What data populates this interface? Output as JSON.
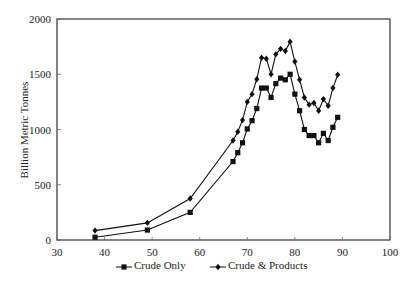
{
  "chart_data": {
    "type": "line",
    "title": "",
    "xlabel": "",
    "ylabel": "Billion Metric Tonnes",
    "xlim": [
      30,
      100
    ],
    "ylim": [
      0,
      2000
    ],
    "xticks": [
      30,
      40,
      50,
      60,
      70,
      80,
      90,
      100
    ],
    "yticks": [
      0,
      500,
      1000,
      1500,
      2000
    ],
    "grid": false,
    "legend_position": "bottom",
    "series": [
      {
        "name": "Crude Only",
        "marker": "square",
        "color": "#111111",
        "x": [
          38,
          49,
          58,
          67,
          68,
          69,
          70,
          71,
          72,
          73,
          74,
          75,
          76,
          77,
          78,
          79,
          80,
          81,
          82,
          83,
          84,
          85,
          86,
          87,
          88,
          89
        ],
        "values": [
          25,
          90,
          250,
          710,
          790,
          880,
          1005,
          1080,
          1190,
          1375,
          1375,
          1290,
          1415,
          1465,
          1450,
          1500,
          1320,
          1170,
          1000,
          945,
          945,
          880,
          965,
          900,
          1020,
          1110
        ]
      },
      {
        "name": "Crude & Products",
        "marker": "diamond",
        "color": "#111111",
        "x": [
          38,
          49,
          58,
          67,
          68,
          69,
          70,
          71,
          72,
          73,
          74,
          75,
          76,
          77,
          78,
          79,
          80,
          81,
          82,
          83,
          84,
          85,
          86,
          87,
          88,
          89
        ],
        "values": [
          85,
          155,
          375,
          900,
          980,
          1085,
          1250,
          1320,
          1455,
          1650,
          1640,
          1500,
          1680,
          1730,
          1710,
          1795,
          1615,
          1450,
          1290,
          1225,
          1240,
          1170,
          1275,
          1215,
          1375,
          1495
        ]
      }
    ]
  }
}
